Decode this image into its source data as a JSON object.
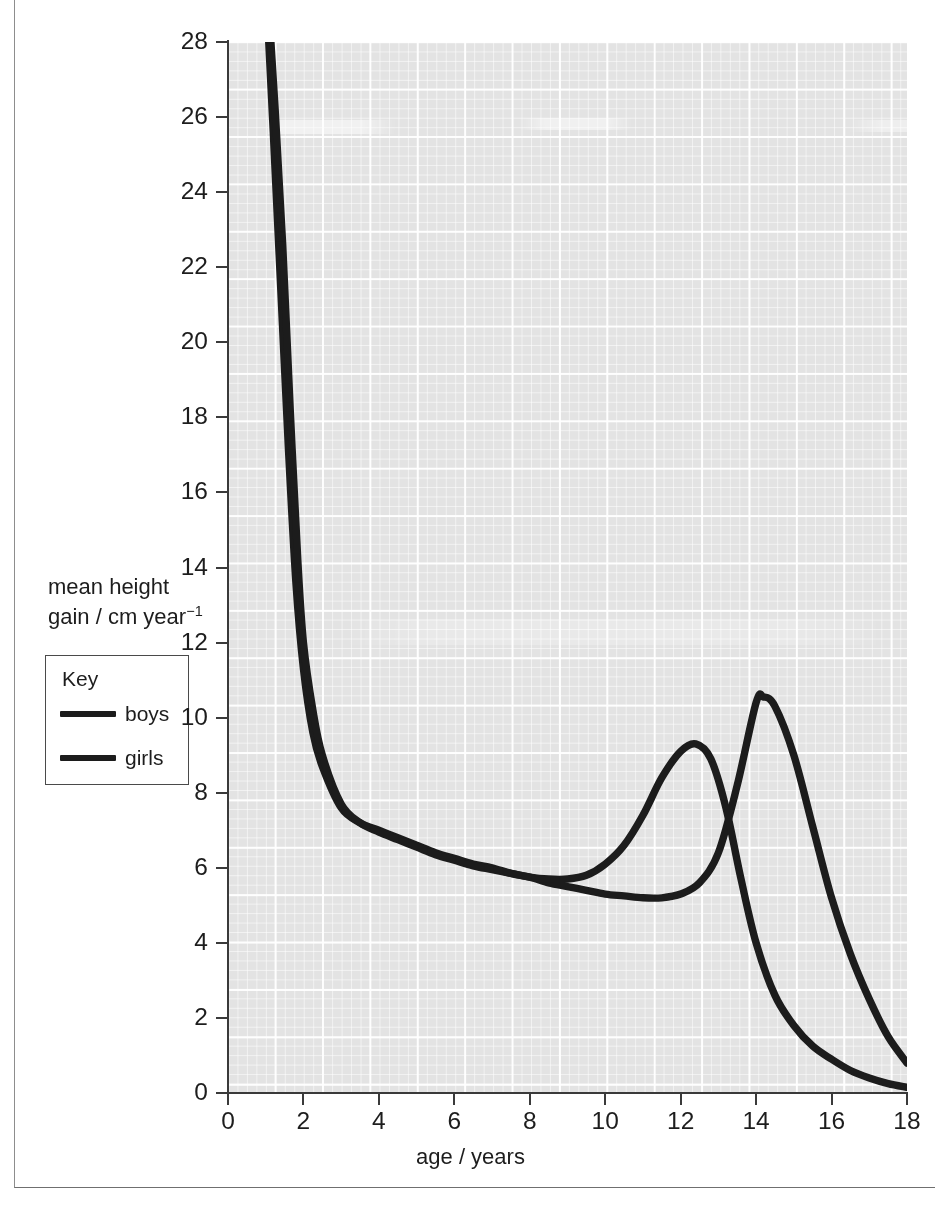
{
  "figure": {
    "frame": {
      "visible": true
    }
  },
  "axes": {
    "x_title": "age / years",
    "y_title_line1": "mean height",
    "y_title_line2_pre": "gain / cm year",
    "y_title_exponent": "−1",
    "x_ticks": [
      "0",
      "2",
      "4",
      "6",
      "8",
      "10",
      "12",
      "14",
      "16",
      "18"
    ],
    "y_ticks": [
      "0",
      "2",
      "4",
      "6",
      "8",
      "10",
      "12",
      "14",
      "16",
      "18",
      "20",
      "22",
      "24",
      "26",
      "28"
    ]
  },
  "key": {
    "title": "Key",
    "items": [
      {
        "label": "boys",
        "color": "#1c1c1c"
      },
      {
        "label": "girls",
        "color": "#1c1c1c"
      }
    ]
  },
  "colors": {
    "curve": "#1c1c1c",
    "axis": "#3a3a3a",
    "paper": "#e3e3e3",
    "grid": "#ffffff",
    "frame": "#8d8d8d"
  },
  "chart_data": {
    "type": "line",
    "title": "",
    "xlabel": "age / years",
    "ylabel": "mean height gain / cm year⁻¹",
    "xlim": [
      0,
      18
    ],
    "ylim": [
      0,
      28
    ],
    "xticks": [
      0,
      2,
      4,
      6,
      8,
      10,
      12,
      14,
      16,
      18
    ],
    "yticks": [
      0,
      2,
      4,
      6,
      8,
      10,
      12,
      14,
      16,
      18,
      20,
      22,
      24,
      26,
      28
    ],
    "grid": true,
    "grid_style": "graph-paper, white gridlines on grey fill, minor 0.25 unit, major 1.25 unit",
    "legend": {
      "title": "Key",
      "position": "left-outside",
      "entries": [
        "boys",
        "girls"
      ]
    },
    "series": [
      {
        "name": "boys",
        "color": "#1c1c1c",
        "x": [
          1.05,
          1.2,
          1.4,
          1.6,
          1.8,
          2.0,
          2.25,
          2.5,
          3.0,
          3.5,
          4.0,
          4.5,
          5.0,
          5.5,
          6.0,
          6.5,
          7.0,
          7.5,
          8.0,
          8.5,
          9.0,
          9.5,
          10.0,
          10.5,
          11.0,
          11.5,
          12.0,
          12.5,
          13.0,
          13.5,
          14.0,
          14.2,
          14.5,
          15.0,
          15.5,
          16.0,
          16.5,
          17.0,
          17.5,
          18.0
        ],
        "y": [
          28.6,
          25.6,
          21.4,
          17.2,
          13.6,
          11.3,
          9.6,
          8.7,
          7.6,
          7.2,
          7.0,
          6.8,
          6.6,
          6.4,
          6.25,
          6.1,
          6.0,
          5.85,
          5.75,
          5.6,
          5.5,
          5.4,
          5.3,
          5.25,
          5.2,
          5.2,
          5.3,
          5.6,
          6.4,
          8.2,
          10.4,
          10.55,
          10.3,
          9.0,
          7.1,
          5.2,
          3.7,
          2.5,
          1.5,
          0.8
        ],
        "peak": {
          "age": 14.2,
          "value": 10.55
        }
      },
      {
        "name": "girls",
        "color": "#1c1c1c",
        "x": [
          1.1,
          1.25,
          1.45,
          1.65,
          1.85,
          2.0,
          2.25,
          2.5,
          3.0,
          3.5,
          4.0,
          4.5,
          5.0,
          5.5,
          6.0,
          6.5,
          7.0,
          7.5,
          8.0,
          8.5,
          9.0,
          9.5,
          10.0,
          10.5,
          11.0,
          11.5,
          12.0,
          12.4,
          12.8,
          13.2,
          13.6,
          14.0,
          14.5,
          15.0,
          15.5,
          16.0,
          16.5,
          17.0,
          17.5,
          18.0
        ],
        "y": [
          28.6,
          26.2,
          22.6,
          18.2,
          14.2,
          12.0,
          10.2,
          9.0,
          7.7,
          7.2,
          6.95,
          6.75,
          6.55,
          6.35,
          6.2,
          6.05,
          5.95,
          5.85,
          5.75,
          5.7,
          5.7,
          5.8,
          6.1,
          6.6,
          7.4,
          8.4,
          9.1,
          9.3,
          8.9,
          7.6,
          5.7,
          4.0,
          2.6,
          1.8,
          1.25,
          0.9,
          0.6,
          0.4,
          0.25,
          0.15
        ],
        "peak": {
          "age": 12.4,
          "value": 9.3
        }
      }
    ],
    "annotations": [
      "curves cross near age 1.8 years",
      "girls' pubertal growth spurt peaks about 2 years earlier than boys'",
      "boys' peak growth rate is higher than girls'"
    ]
  }
}
